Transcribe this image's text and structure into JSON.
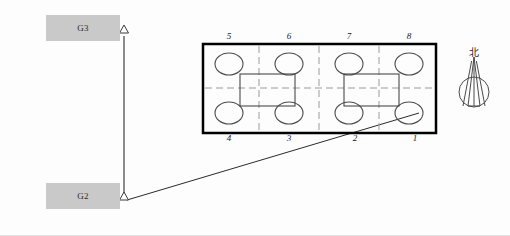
{
  "diagram": {
    "type": "survey-measurement-layout",
    "canvas": {
      "width": 510,
      "height": 236,
      "background": "#fdfdfd"
    },
    "colors": {
      "station_box_fill": "#c9c9c9",
      "carbody_outline": "#000000",
      "grid_dash": "#9a9a9a",
      "wheel_outline": "#4a4a4a",
      "bogie_outline": "#4a4a4a",
      "sight_line": "#2a2a2a",
      "label_text": "#1a1a1a"
    },
    "stations": [
      {
        "id": "G3",
        "label": "G3",
        "box": {
          "x": 46,
          "y": 15,
          "width": 74,
          "height": 26
        },
        "marker": {
          "x": 124,
          "y": 33,
          "shape": "hollow-triangle"
        }
      },
      {
        "id": "G2",
        "label": "G2",
        "box": {
          "x": 46,
          "y": 183,
          "width": 74,
          "height": 26
        },
        "marker": {
          "x": 124,
          "y": 200,
          "shape": "hollow-triangle"
        }
      }
    ],
    "sight_lines": [
      {
        "name": "g3-to-g2-baseline",
        "x1": 124,
        "y1": 36,
        "x2": 124,
        "y2": 199
      },
      {
        "name": "g2-to-axle-1",
        "x1": 127,
        "y1": 200,
        "x2": 419,
        "y2": 113
      }
    ],
    "carbody": {
      "name": "vehicle-outline",
      "x": 203,
      "y": 44,
      "width": 233,
      "height": 89,
      "stroke_width": 2.5
    },
    "grid": {
      "vertical_dashes_x": [
        259,
        319,
        379
      ],
      "horizontal_dash_y": 88,
      "style": "dashed"
    },
    "wheels": [
      {
        "label": "5",
        "cx": 229,
        "cy": 64,
        "rx": 14,
        "ry": 11
      },
      {
        "label": "6",
        "cx": 289,
        "cy": 64,
        "rx": 14,
        "ry": 11
      },
      {
        "label": "7",
        "cx": 349,
        "cy": 64,
        "rx": 14,
        "ry": 11
      },
      {
        "label": "8",
        "cx": 409,
        "cy": 64,
        "rx": 14,
        "ry": 11
      },
      {
        "label": "4",
        "cx": 229,
        "cy": 113,
        "rx": 14,
        "ry": 11
      },
      {
        "label": "3",
        "cx": 289,
        "cy": 113,
        "rx": 14,
        "ry": 11
      },
      {
        "label": "2",
        "cx": 349,
        "cy": 113,
        "rx": 14,
        "ry": 11
      },
      {
        "label": "1",
        "cx": 409,
        "cy": 113,
        "rx": 14,
        "ry": 11
      }
    ],
    "bogies": [
      {
        "name": "bogie-left",
        "x": 240,
        "y": 74,
        "width": 55,
        "height": 32
      },
      {
        "name": "bogie-right",
        "x": 344,
        "y": 74,
        "width": 55,
        "height": 32
      }
    ],
    "axle_labels_top": [
      {
        "text": "5",
        "x": 222,
        "y": 31
      },
      {
        "text": "6",
        "x": 282,
        "y": 31
      },
      {
        "text": "7",
        "x": 342,
        "y": 31
      },
      {
        "text": "8",
        "x": 402,
        "y": 31
      }
    ],
    "axle_labels_bottom": [
      {
        "text": "4",
        "x": 222,
        "y": 133
      },
      {
        "text": "3",
        "x": 282,
        "y": 133
      },
      {
        "text": "2",
        "x": 348,
        "y": 133
      },
      {
        "text": "1",
        "x": 408,
        "y": 133
      }
    ],
    "compass": {
      "name": "north-arrow",
      "label": "北",
      "label_x": 464,
      "label_y": 44,
      "circle_cx": 474,
      "circle_cy": 92,
      "circle_r": 15,
      "needle_apex_y": 57
    }
  }
}
